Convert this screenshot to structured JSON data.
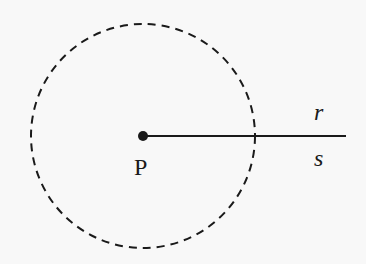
{
  "diagram": {
    "point_label": "P",
    "ray_upper_label": "r",
    "ray_lower_label": "s",
    "colors": {
      "background": "#f8f8f8",
      "stroke": "#1a1a1a"
    },
    "circle": {
      "cx": 143,
      "cy": 136,
      "r": 112,
      "style": "dashed"
    },
    "ray": {
      "x1": 143,
      "y1": 136,
      "x2": 346,
      "y2": 136
    },
    "point": {
      "cx": 143,
      "cy": 136,
      "r": 5
    }
  }
}
